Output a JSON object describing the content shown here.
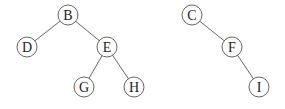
{
  "diagram": {
    "type": "binary-trees",
    "trees": [
      {
        "name": "tree-1",
        "root": "B",
        "nodes": [
          {
            "id": "B",
            "label": "B",
            "x": 68,
            "y": 15
          },
          {
            "id": "D",
            "label": "D",
            "x": 27,
            "y": 47
          },
          {
            "id": "E",
            "label": "E",
            "x": 107,
            "y": 47
          },
          {
            "id": "G",
            "label": "G",
            "x": 84,
            "y": 87
          },
          {
            "id": "H",
            "label": "H",
            "x": 134,
            "y": 87
          }
        ],
        "edges": [
          [
            "B",
            "D"
          ],
          [
            "B",
            "E"
          ],
          [
            "E",
            "G"
          ],
          [
            "E",
            "H"
          ]
        ]
      },
      {
        "name": "tree-2",
        "root": "C",
        "nodes": [
          {
            "id": "C",
            "label": "C",
            "x": 192,
            "y": 15
          },
          {
            "id": "F",
            "label": "F",
            "x": 232,
            "y": 47
          },
          {
            "id": "I",
            "label": "I",
            "x": 259,
            "y": 87
          }
        ],
        "edges": [
          [
            "C",
            "F"
          ],
          [
            "F",
            "I"
          ]
        ]
      }
    ],
    "node_radius": 10
  }
}
